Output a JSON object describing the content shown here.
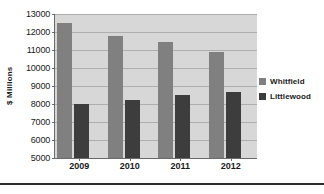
{
  "chart_data": {
    "type": "bar",
    "title": "",
    "subtitle": "",
    "xlabel": "",
    "ylabel": "$ Millions",
    "categories": [
      "2009",
      "2010",
      "2011",
      "2012"
    ],
    "series": [
      {
        "name": "Whitfield",
        "color": "#808080",
        "values": [
          12500,
          11800,
          11450,
          10900
        ]
      },
      {
        "name": "Littlewood",
        "color": "#3d3d3d",
        "values": [
          8000,
          8200,
          8500,
          8670
        ]
      }
    ],
    "ylim": [
      5000,
      13000
    ],
    "ytick_step": 1000,
    "yticks": [
      "5000",
      "6000",
      "7000",
      "8000",
      "9000",
      "10000",
      "11000",
      "12000",
      "13000"
    ],
    "grid": true,
    "legend_position": "right",
    "plot_background": "#d7d7d7",
    "axis_color": "#6b6b6b",
    "gridline_color": "#aeaeae"
  }
}
